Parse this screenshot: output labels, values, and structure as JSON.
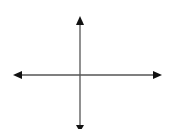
{
  "diagram": {
    "type": "coordinate-axes",
    "line_color": "#555555",
    "arrow_color": "#111111",
    "background": "#ffffff",
    "horizontal_axis": {
      "y": 75,
      "x_start": 13,
      "x_end": 162
    },
    "vertical_axis": {
      "x": 80,
      "y_start": 16,
      "y_end": 131
    },
    "labels": []
  }
}
